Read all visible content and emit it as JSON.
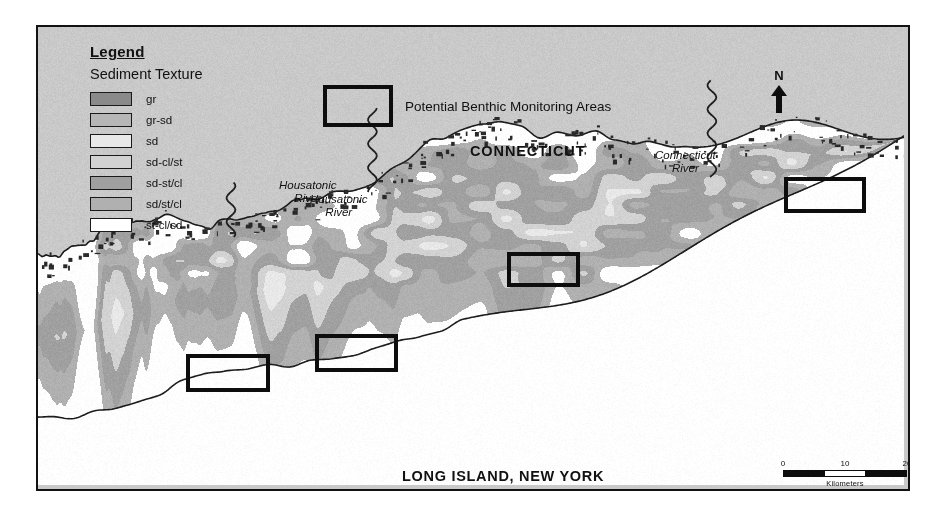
{
  "map": {
    "background_color": "#c9c9c9",
    "frame_color": "#121212",
    "land_color": "#ffffff"
  },
  "legend": {
    "title": "Legend",
    "subtitle": "Sediment Texture",
    "items": [
      {
        "label": "gr",
        "color": "#8a8a8a"
      },
      {
        "label": "gr-sd",
        "color": "#b6b6b6"
      },
      {
        "label": "sd",
        "color": "#e8e8e8"
      },
      {
        "label": "sd-cl/st",
        "color": "#d2d2d2"
      },
      {
        "label": "sd-st/cl",
        "color": "#a0a0a0"
      },
      {
        "label": "sd/st/cl",
        "color": "#b0b0b0"
      },
      {
        "label": "st-cl/sd",
        "color": "#ffffff"
      }
    ]
  },
  "benthic_key": {
    "label": "Potential Benthic Monitoring Areas"
  },
  "labels": {
    "connecticut": "CONNECTICUT",
    "long_island": "LONG ISLAND, NEW YORK",
    "housatonic_river_a": "Housatonic\nRiver",
    "housatonic_river_b": "Housatonic\nRiver",
    "connecticut_river": "Connecticut\nRiver"
  },
  "north_arrow": {
    "letter": "N"
  },
  "scale_bar": {
    "ticks": [
      "0",
      "10",
      "20"
    ],
    "caption": "Kilometers"
  },
  "monitoring_areas": [
    {
      "name": "monitoring-area-1",
      "left": 148,
      "top": 327,
      "width": 84,
      "height": 38
    },
    {
      "name": "monitoring-area-2",
      "left": 277,
      "top": 307,
      "width": 83,
      "height": 38
    },
    {
      "name": "monitoring-area-3",
      "left": 469,
      "top": 225,
      "width": 73,
      "height": 35
    },
    {
      "name": "monitoring-area-4",
      "left": 746,
      "top": 150,
      "width": 82,
      "height": 36
    }
  ]
}
